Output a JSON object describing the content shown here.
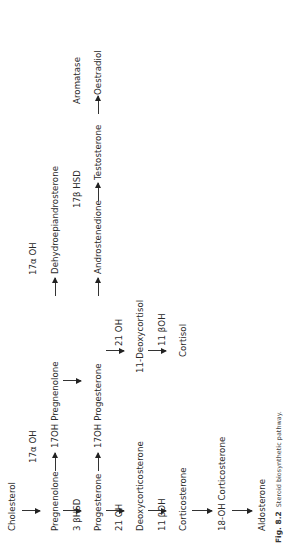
{
  "figure": {
    "caption_label": "Fig. 8.2",
    "caption_text": "Steroid biosynthetic pathway.",
    "orientation": "rotated 90° counter-clockwise"
  },
  "nodes": {
    "cholesterol": "Cholesterol",
    "pregnenolone": "Pregnenolone",
    "oh17_pregnenolone": "17OH Pregnenolone",
    "dhea": "Dehydroepiandrosterone",
    "progesterone": "Progesterone",
    "oh17_progesterone": "17OH Progesterone",
    "androstenedione": "Androstenedione",
    "testosterone": "Testosterone",
    "oestradiol": "Oestradiol",
    "deoxycorticosterone": "Deoxycorticosterone",
    "deoxycortisol11": "11-Deoxycortisol",
    "corticosterone": "Corticosterone",
    "cortisol": "Cortisol",
    "oh18_corticosterone": "18-OH Corticosterone",
    "aldosterone": "Aldosterone"
  },
  "enzymes": {
    "oh17_a": "17α OH",
    "oh17_b": "17α OH",
    "hsd3b": "3 βHSD",
    "hsd17b": "17β HSD",
    "aromatase": "Aromatase",
    "oh21_a": "21 OH",
    "oh21_b": "21 OH",
    "oh11b_a": "11 βOH",
    "oh11b_b": "11 βOH"
  },
  "edges": [
    {
      "from": "Cholesterol",
      "to": "Pregnenolone"
    },
    {
      "from": "Pregnenolone",
      "to": "17OH Pregnenolone",
      "enzyme": "17α OH"
    },
    {
      "from": "17OH Pregnenolone",
      "to": "Dehydroepiandrosterone",
      "enzyme": "17α OH"
    },
    {
      "from": "Pregnenolone",
      "to": "Progesterone",
      "enzyme": "3 βHSD"
    },
    {
      "from": "17OH Pregnenolone",
      "to": "17OH Progesterone"
    },
    {
      "from": "Progesterone",
      "to": "17OH Progesterone"
    },
    {
      "from": "17OH Progesterone",
      "to": "Androstenedione"
    },
    {
      "from": "Androstenedione",
      "to": "Testosterone",
      "enzyme": "17β HSD"
    },
    {
      "from": "Testosterone",
      "to": "Oestradiol",
      "enzyme": "Aromatase"
    },
    {
      "from": "Progesterone",
      "to": "Deoxycorticosterone",
      "enzyme": "21 OH"
    },
    {
      "from": "17OH Progesterone",
      "to": "11-Deoxycortisol",
      "enzyme": "21 OH"
    },
    {
      "from": "Deoxycorticosterone",
      "to": "Corticosterone",
      "enzyme": "11 βOH"
    },
    {
      "from": "11-Deoxycortisol",
      "to": "Cortisol",
      "enzyme": "11 βOH"
    },
    {
      "from": "Corticosterone",
      "to": "18-OH Corticosterone"
    },
    {
      "from": "18-OH Corticosterone",
      "to": "Aldosterone"
    }
  ]
}
